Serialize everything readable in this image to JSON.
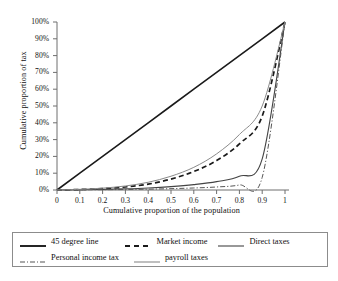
{
  "chart_data": {
    "type": "line",
    "title": "",
    "xlabel": "Cumulative proportion of the population",
    "ylabel": "Cumulative proportion of tax",
    "xlim": [
      0,
      1
    ],
    "ylim": [
      0,
      1
    ],
    "grid": false,
    "legend_position": "bottom",
    "x_ticks": [
      "0",
      "0.1",
      "0.2",
      "0.3",
      "0.4",
      "0.5",
      "0.6",
      "0.7",
      "0.8",
      "0.9",
      "1"
    ],
    "x_tick_values": [
      0,
      0.1,
      0.2,
      0.3,
      0.4,
      0.5,
      0.6,
      0.7,
      0.8,
      0.9,
      1
    ],
    "y_ticks": [
      "0%",
      "10%",
      "20%",
      "30%",
      "40%",
      "50%",
      "60%",
      "70%",
      "80%",
      "90%",
      "100%"
    ],
    "y_tick_values": [
      0,
      0.1,
      0.2,
      0.3,
      0.4,
      0.5,
      0.6,
      0.7,
      0.8,
      0.9,
      1
    ],
    "x": [
      0,
      0.1,
      0.2,
      0.3,
      0.4,
      0.5,
      0.6,
      0.7,
      0.8,
      0.9,
      1
    ],
    "series": [
      {
        "name": "45 degree line",
        "style": "solid",
        "color": "#1a1a1a",
        "width": 1.6,
        "values": [
          0,
          0.1,
          0.2,
          0.3,
          0.4,
          0.5,
          0.6,
          0.7,
          0.8,
          0.9,
          1
        ]
      },
      {
        "name": "Market income",
        "style": "dashed",
        "color": "#1a1a1a",
        "width": 1.7,
        "values": [
          0,
          0.003,
          0.008,
          0.018,
          0.035,
          0.065,
          0.11,
          0.175,
          0.275,
          0.44,
          1
        ]
      },
      {
        "name": "Direct taxes",
        "style": "solid",
        "color": "#444444",
        "width": 1.1,
        "values": [
          0,
          0.002,
          0.004,
          0.007,
          0.012,
          0.02,
          0.032,
          0.05,
          0.082,
          0.185,
          1
        ]
      },
      {
        "name": "Personal income tax",
        "style": "dashdot",
        "color": "#555555",
        "width": 1.0,
        "values": [
          0,
          0.001,
          0.002,
          0.003,
          0.005,
          0.008,
          0.012,
          0.018,
          0.03,
          0.075,
          1
        ]
      },
      {
        "name": "payroll taxes",
        "style": "solid",
        "color": "#8a8a8a",
        "width": 1.0,
        "values": [
          0,
          0.004,
          0.011,
          0.024,
          0.046,
          0.082,
          0.135,
          0.215,
          0.33,
          0.5,
          1
        ]
      }
    ]
  },
  "legend": {
    "row1": [
      {
        "label": "45 degree line",
        "swatch": "solid-black-thick"
      },
      {
        "label": "Market income",
        "swatch": "dashed-black"
      },
      {
        "label": "Direct taxes",
        "swatch": "solid-darkgray"
      }
    ],
    "row2": [
      {
        "label": "Personal income tax",
        "swatch": "dashdot-gray"
      },
      {
        "label": "payroll taxes",
        "swatch": "solid-gray"
      }
    ]
  }
}
